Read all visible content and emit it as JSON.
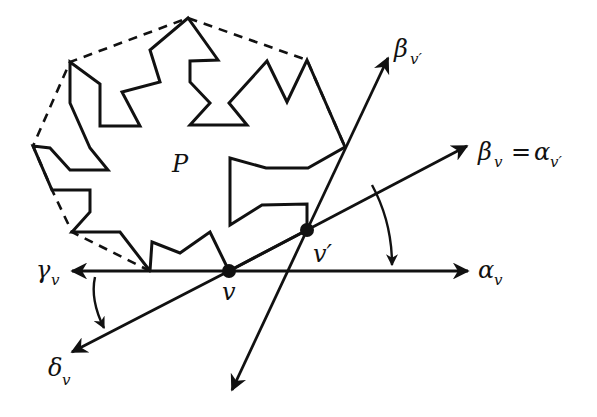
{
  "figure": {
    "type": "geometry-diagram",
    "polygon": {
      "label": "P",
      "label_pos": [
        182,
        168
      ],
      "boundary": [
        [
          150,
          271
        ],
        [
          152,
          242
        ],
        [
          180,
          253
        ],
        [
          210,
          232
        ],
        [
          229,
          271
        ],
        [
          307,
          230
        ],
        [
          307,
          204
        ],
        [
          262,
          205
        ],
        [
          230,
          225
        ],
        [
          230,
          158
        ],
        [
          266,
          168
        ],
        [
          308,
          168
        ],
        [
          345,
          147
        ],
        [
          307,
          60
        ],
        [
          287,
          102
        ],
        [
          267,
          61
        ],
        [
          229,
          103
        ],
        [
          247,
          125
        ],
        [
          190,
          125
        ],
        [
          210,
          103
        ],
        [
          190,
          82
        ],
        [
          190,
          61
        ],
        [
          218,
          60
        ],
        [
          188,
          18
        ],
        [
          150,
          50
        ],
        [
          160,
          82
        ],
        [
          122,
          92
        ],
        [
          140,
          126
        ],
        [
          100,
          126
        ],
        [
          100,
          84
        ],
        [
          70,
          62
        ],
        [
          70,
          103
        ],
        [
          90,
          148
        ],
        [
          108,
          170
        ],
        [
          70,
          170
        ],
        [
          50,
          148
        ],
        [
          33,
          146
        ],
        [
          52,
          190
        ],
        [
          90,
          190
        ],
        [
          90,
          212
        ],
        [
          72,
          232
        ],
        [
          120,
          232
        ],
        [
          150,
          271
        ]
      ],
      "hull": [
        [
          150,
          271
        ],
        [
          72,
          232
        ],
        [
          52,
          190
        ],
        [
          33,
          146
        ],
        [
          70,
          62
        ],
        [
          188,
          18
        ],
        [
          307,
          60
        ],
        [
          345,
          147
        ]
      ]
    },
    "vertices": [
      {
        "name": "v",
        "label": "v",
        "pos": [
          229,
          271
        ]
      },
      {
        "name": "v-prime",
        "label": "v′",
        "pos": [
          307,
          230
        ]
      }
    ],
    "rays": [
      {
        "name": "alpha-v",
        "label": "α",
        "sub": "v",
        "from": [
          229,
          271
        ],
        "to": [
          468,
          271
        ],
        "label_pos": [
          478,
          278
        ]
      },
      {
        "name": "gamma-v",
        "label": "γ",
        "sub": "v",
        "from": [
          229,
          271
        ],
        "to": [
          72,
          271
        ],
        "label_pos": [
          36,
          278
        ]
      },
      {
        "name": "delta-v",
        "label": "δ",
        "sub": "v",
        "from": [
          229,
          271
        ],
        "to": [
          72,
          352
        ],
        "label_pos": [
          48,
          382
        ]
      },
      {
        "name": "beta-v",
        "label": "β",
        "sub": "v",
        "extra": " = α",
        "extra_sub": "v′",
        "from": [
          229,
          271
        ],
        "to": [
          467,
          146
        ],
        "label_pos": [
          478,
          158
        ]
      },
      {
        "name": "beta-v-prime",
        "label": "β",
        "sub": "v′",
        "from": [
          307,
          230
        ],
        "to": [
          388,
          58
        ],
        "label_pos": [
          394,
          55
        ]
      },
      {
        "name": "beta-v-prime-back",
        "label": "",
        "from": [
          307,
          230
        ],
        "to": [
          232,
          390
        ]
      }
    ],
    "angle_arrows": [
      {
        "name": "turn-arrow-right",
        "path": "M 372 185 Q 392 222 392 265"
      },
      {
        "name": "turn-arrow-left",
        "path": "M 95 277 Q 90 300 104 328"
      }
    ],
    "labels": {
      "P": "P",
      "v": "v",
      "v_prime": "v′",
      "alpha": "α",
      "beta": "β",
      "gamma": "γ",
      "delta": "δ",
      "equals": "=",
      "sub_v": "v",
      "sub_v_prime": "v′"
    }
  }
}
